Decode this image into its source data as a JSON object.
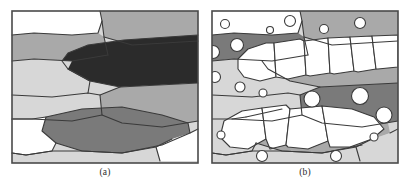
{
  "figure": {
    "background_color": "#ffffff",
    "panel_width": 186,
    "panel_height": 152,
    "stroke_color": "#3a3a3a",
    "frame_color": "#4a4a4a"
  },
  "palette": {
    "white": "#ffffff",
    "light_gray": "#d7d7d7",
    "mid_gray": "#a9a9a9",
    "dark_gray": "#7a7a7a",
    "near_black": "#2b2b2b"
  },
  "panels": [
    {
      "id": "a",
      "caption": "(a)",
      "fill_base": "#d7d7d7",
      "regions": [
        {
          "name": "top-left-white-grain",
          "fill": "#ffffff",
          "path": "M0,0 L88,0 L90,10 L86,22 L60,24 L22,22 L0,24 Z"
        },
        {
          "name": "top-right-mid-grain",
          "fill": "#a9a9a9",
          "path": "M88,0 L186,0 L186,30 L120,34 L92,26 L90,10 Z"
        },
        {
          "name": "upper-mid-band-gray",
          "fill": "#a9a9a9",
          "path": "M0,24 L22,22 L60,24 L86,22 L92,26 L96,44 L60,50 L22,48 L0,50 Z"
        },
        {
          "name": "dark-lens-inclusion",
          "fill": "#2b2b2b",
          "path": "M186,24 L186,72 L108,76 L78,70 L56,58 L50,50 L56,42 L76,34 L112,29 Z"
        },
        {
          "name": "left-light-band",
          "fill": "#d7d7d7",
          "path": "M0,50 L22,48 L60,50 L56,58 L78,70 L76,82 L40,86 L0,84 Z"
        },
        {
          "name": "mid-left-light-grain",
          "fill": "#d7d7d7",
          "path": "M0,84 L40,86 L76,82 L88,84 L90,104 L60,110 L20,108 L0,108 Z"
        },
        {
          "name": "center-mid-grain",
          "fill": "#a9a9a9",
          "path": "M88,84 L108,76 L186,72 L186,110 L150,116 L110,112 L90,104 Z"
        },
        {
          "name": "lower-dark-blob",
          "fill": "#7a7a7a",
          "path": "M34,106 L70,98 L110,96 L150,104 L176,112 L178,122 L150,134 L110,142 L70,140 L44,132 L30,120 Z"
        },
        {
          "name": "bottom-left-white-grain",
          "fill": "#ffffff",
          "path": "M0,108 L20,108 L34,106 L30,120 L44,132 L40,140 L14,144 L0,142 Z"
        },
        {
          "name": "bottom-right-white-grain",
          "fill": "#ffffff",
          "path": "M178,122 L186,118 L186,150 L148,150 L144,136 L160,128 Z"
        },
        {
          "name": "bottom-strip-light",
          "fill": "#d7d7d7",
          "path": "M0,142 L14,144 L40,140 L70,140 L110,142 L144,136 L148,150 L0,152 Z"
        }
      ],
      "edges": [
        "M88,0 L90,10 L92,26 L96,44",
        "M0,24 L22,22 L60,24 L86,22 L90,10",
        "M0,50 L22,48 L60,50 L96,44",
        "M186,30 L120,34 L92,26",
        "M0,84 L40,86 L76,82 L88,84 L108,76",
        "M186,72 L108,76 L78,70 L56,58 L50,50 L56,42 L76,34 L112,29 L186,24",
        "M56,58 L78,70 L76,82",
        "M88,84 L90,104 L60,110 L20,108 L0,108",
        "M90,104 L110,112 L150,116 L186,110",
        "M34,106 L70,98 L110,96 L150,104 L176,112 L178,122 L150,134 L110,142 L70,140 L44,132 L30,120 Z",
        "M0,108 L20,108 L34,106",
        "M44,132 L40,140 L14,144 L0,142",
        "M178,122 L186,118",
        "M160,128 L144,136 L148,150",
        "M0,142 L14,144 L40,140 L70,140 L110,142 L144,136"
      ],
      "circles": []
    },
    {
      "id": "b",
      "caption": "(b)",
      "fill_base": "#d7d7d7",
      "regions": [
        {
          "name": "top-left-white-grain",
          "fill": "#ffffff",
          "path": "M0,0 L88,0 L90,10 L86,22 L60,24 L22,22 L0,24 Z"
        },
        {
          "name": "top-right-mid-grain",
          "fill": "#a9a9a9",
          "path": "M88,0 L186,0 L186,30 L120,34 L92,26 L90,10 Z"
        },
        {
          "name": "upper-dark-band",
          "fill": "#7a7a7a",
          "path": "M0,24 L22,22 L60,24 L86,22 L92,26 L96,44 L60,50 L22,48 L0,50 Z"
        },
        {
          "name": "upper-right-base-band",
          "fill": "#a9a9a9",
          "path": "M186,24 L186,72 L108,76 L78,70 L56,58 L50,50 L56,42 L76,34 L112,29 Z"
        },
        {
          "name": "left-light-band",
          "fill": "#d7d7d7",
          "path": "M0,50 L22,48 L60,50 L56,58 L78,70 L76,82 L40,86 L0,84 Z"
        },
        {
          "name": "mid-left-light-grain",
          "fill": "#d7d7d7",
          "path": "M0,84 L40,86 L76,82 L88,84 L90,104 L60,110 L20,108 L0,108 Z"
        },
        {
          "name": "center-dark-band",
          "fill": "#7a7a7a",
          "path": "M88,84 L108,76 L186,72 L186,110 L150,116 L110,112 L90,104 Z"
        },
        {
          "name": "lower-mid-grain",
          "fill": "#a9a9a9",
          "path": "M34,106 L70,98 L110,96 L150,104 L176,112 L178,122 L150,134 L110,142 L70,140 L44,132 L30,120 Z"
        },
        {
          "name": "bottom-left-light-grain",
          "fill": "#d7d7d7",
          "path": "M0,108 L20,108 L34,106 L30,120 L44,132 L40,140 L14,144 L0,142 Z"
        },
        {
          "name": "bottom-right-light-grain",
          "fill": "#d7d7d7",
          "path": "M178,122 L186,118 L186,150 L148,150 L144,136 L160,128 Z"
        },
        {
          "name": "bottom-strip-light",
          "fill": "#d7d7d7",
          "path": "M0,142 L14,144 L40,140 L70,140 L110,142 L144,136 L148,150 L0,152 Z"
        }
      ],
      "recrystallized_grains": [
        {
          "name": "rx-grain-1",
          "path": "M26,48 L36,38 L54,32 L62,32 L64,66 L48,70 L32,66 L26,58 Z"
        },
        {
          "name": "rx-grain-2",
          "path": "M62,32 L88,28 L92,30 L94,64 L76,68 L64,66 Z"
        },
        {
          "name": "rx-grain-3",
          "path": "M92,30 L116,27 L118,62 L98,65 L94,64 Z"
        },
        {
          "name": "rx-grain-4",
          "path": "M116,27 L138,26 L142,60 L122,63 L118,62 Z"
        },
        {
          "name": "rx-grain-5",
          "path": "M138,26 L160,25 L164,58 L146,61 L142,60 Z"
        },
        {
          "name": "rx-grain-6",
          "path": "M160,25 L186,24 L186,56 L166,58 L164,58 Z"
        },
        {
          "name": "rx-grain-7",
          "path": "M12,110 L30,100 L50,97 L54,128 L36,138 L18,136 L8,126 Z"
        },
        {
          "name": "rx-grain-8",
          "path": "M50,97 L74,94 L78,98 L74,134 L58,138 L54,128 Z"
        },
        {
          "name": "rx-grain-9",
          "path": "M78,98 L110,95 L116,130 L96,138 L76,136 L74,134 Z"
        },
        {
          "name": "rx-grain-10",
          "path": "M116,130 L110,95 L140,98 L162,106 L172,118 L160,128 L138,136 L118,136 Z"
        }
      ],
      "edges": [
        "M88,0 L90,10 L92,26 L96,44",
        "M0,24 L22,22 L60,24 L86,22 L90,10",
        "M0,50 L22,48 L60,50 L96,44",
        "M186,30 L120,34 L92,26",
        "M0,84 L40,86 L76,82 L88,84 L108,76",
        "M186,72 L108,76 L78,70 L56,58 L50,50",
        "M0,108 L20,108 L34,106",
        "M88,84 L90,104 L60,110 L20,108",
        "M90,104 L110,112 L150,116 L186,110",
        "M34,106 L70,98",
        "M150,134 L110,142 L70,140 L44,132",
        "M44,132 L40,140 L14,144 L0,142",
        "M178,122 L186,118",
        "M160,128 L144,136 L148,150",
        "M0,142 L14,144 L40,140 L70,140 L110,142 L144,136"
      ],
      "particles": [
        {
          "name": "particle",
          "cx": 13,
          "cy": 13,
          "r": 4.5
        },
        {
          "name": "particle",
          "cx": 58,
          "cy": 19,
          "r": 3.5
        },
        {
          "name": "particle",
          "cx": 78,
          "cy": 10,
          "r": 5.5
        },
        {
          "name": "particle",
          "cx": 112,
          "cy": 18,
          "r": 4.5
        },
        {
          "name": "particle",
          "cx": 148,
          "cy": 12,
          "r": 5.5
        },
        {
          "name": "particle",
          "cx": 1,
          "cy": 41,
          "r": 6.5
        },
        {
          "name": "particle",
          "cx": 25,
          "cy": 34,
          "r": 6.5
        },
        {
          "name": "particle",
          "cx": 3,
          "cy": 66,
          "r": 5.5
        },
        {
          "name": "particle",
          "cx": 28,
          "cy": 76,
          "r": 5.0
        },
        {
          "name": "particle",
          "cx": 51,
          "cy": 82,
          "r": 4.0
        },
        {
          "name": "particle",
          "cx": 100,
          "cy": 88,
          "r": 8.0
        },
        {
          "name": "particle",
          "cx": 148,
          "cy": 85,
          "r": 8.5
        },
        {
          "name": "particle",
          "cx": 172,
          "cy": 104,
          "r": 8.0
        },
        {
          "name": "particle",
          "cx": 9,
          "cy": 124,
          "r": 4.0
        },
        {
          "name": "particle",
          "cx": 162,
          "cy": 126,
          "r": 4.0
        },
        {
          "name": "particle",
          "cx": 50,
          "cy": 145,
          "r": 5.5
        },
        {
          "name": "particle",
          "cx": 124,
          "cy": 145,
          "r": 5.5
        }
      ]
    }
  ]
}
